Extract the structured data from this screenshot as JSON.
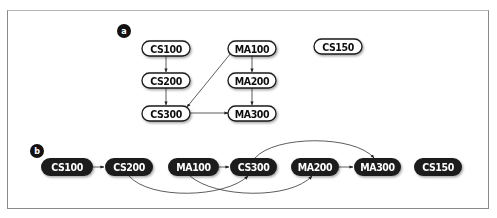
{
  "diagram": {
    "panel_a": {
      "label": "a",
      "nodes": [
        {
          "id": "CS100",
          "label": "CS100"
        },
        {
          "id": "CS200",
          "label": "CS200"
        },
        {
          "id": "CS300",
          "label": "CS300"
        },
        {
          "id": "MA100",
          "label": "MA100"
        },
        {
          "id": "MA200",
          "label": "MA200"
        },
        {
          "id": "MA300",
          "label": "MA300"
        },
        {
          "id": "CS150",
          "label": "CS150"
        }
      ],
      "edges": [
        {
          "from": "CS100",
          "to": "CS200"
        },
        {
          "from": "CS200",
          "to": "CS300"
        },
        {
          "from": "MA100",
          "to": "CS300"
        },
        {
          "from": "MA100",
          "to": "MA200"
        },
        {
          "from": "MA200",
          "to": "MA300"
        },
        {
          "from": "CS300",
          "to": "MA300"
        }
      ]
    },
    "panel_b": {
      "label": "b",
      "nodes": [
        {
          "id": "CS100",
          "label": "CS100"
        },
        {
          "id": "CS200",
          "label": "CS200"
        },
        {
          "id": "MA100",
          "label": "MA100"
        },
        {
          "id": "CS300",
          "label": "CS300"
        },
        {
          "id": "MA200",
          "label": "MA200"
        },
        {
          "id": "MA300",
          "label": "MA300"
        },
        {
          "id": "CS150",
          "label": "CS150"
        }
      ],
      "edges": [
        {
          "from": "CS100",
          "to": "CS200"
        },
        {
          "from": "CS200",
          "to": "CS300"
        },
        {
          "from": "MA100",
          "to": "CS300"
        },
        {
          "from": "MA100",
          "to": "MA200"
        },
        {
          "from": "CS300",
          "to": "MA300"
        },
        {
          "from": "MA200",
          "to": "MA300"
        }
      ]
    },
    "colors": {
      "node_fill_a": "#ffffff",
      "node_stroke": "#1a1a1a",
      "node_fill_b": "#1c1c1c",
      "node_text_b": "#ffffff",
      "edge": "#333333",
      "frame": "#8a8a8a"
    }
  }
}
